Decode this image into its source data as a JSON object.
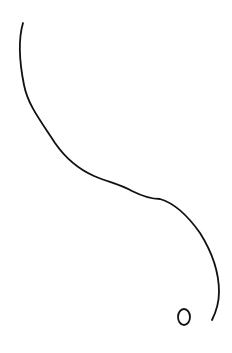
{
  "sketch": {
    "background": "#ffffff",
    "stroke_color": "#111111",
    "strokes": [
      {
        "name": "long-curve",
        "path": "M23,23 C18,40 19,60 24,85 C28,105 40,120 55,143 C64,156 76,168 94,176 C108,182 120,184 132,191 C142,196 150,199 160,199 C174,203 188,216 200,233 C212,252 219,272 219,292 C219,304 216,312 212,320",
        "width": 1.8
      },
      {
        "name": "small-loop",
        "cx": 184,
        "cy": 317,
        "rx": 6,
        "ry": 8,
        "width": 1.8
      }
    ]
  }
}
